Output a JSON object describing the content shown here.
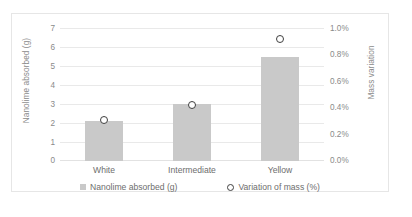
{
  "chart_data": {
    "type": "bar",
    "title": "",
    "categories": [
      "White",
      "Intermediate",
      "Yellow"
    ],
    "series": [
      {
        "name": "Nanolime absorbed (g)",
        "type": "bar",
        "axis": "left",
        "color": "#c9c9c9",
        "marker": "square",
        "values": [
          2.1,
          3.0,
          5.5
        ]
      },
      {
        "name": "Variation of mass (%)",
        "type": "scatter",
        "axis": "right",
        "color": "#3f3f3f",
        "marker": "open-circle",
        "values": [
          0.3,
          0.42,
          0.92
        ]
      }
    ],
    "xlabel": "",
    "ylabel": "Nanolime absorbed (g)",
    "y2label": "Mass variation",
    "ylim": [
      0,
      7
    ],
    "y2lim": [
      0,
      1.0
    ],
    "yticks": [
      "0",
      "1",
      "2",
      "3",
      "4",
      "5",
      "6",
      "7"
    ],
    "y2ticks": [
      "0.0%",
      "0.2%",
      "0.4%",
      "0.6%",
      "0.8%",
      "1.0%"
    ],
    "grid": true,
    "legend_position": "bottom"
  },
  "axes": {
    "left_title": "Nanolime absorbed (g)",
    "right_title": "Mass variation",
    "left_ticks": [
      "7",
      "6",
      "5",
      "4",
      "3",
      "2",
      "1",
      "0"
    ],
    "right_ticks": [
      "1.0%",
      "0.8%",
      "0.6%",
      "0.4%",
      "0.2%",
      "0.0%"
    ]
  },
  "categories": [
    {
      "label": "White"
    },
    {
      "label": "Intermediate"
    },
    {
      "label": "Yellow"
    }
  ],
  "legend": {
    "items": [
      {
        "label": "Nanolime absorbed (g)",
        "marker": "square-swatch",
        "color": "#c9c9c9"
      },
      {
        "label": "Variation of mass (%)",
        "marker": "open-circle-swatch",
        "color": "#3f3f3f"
      }
    ]
  }
}
